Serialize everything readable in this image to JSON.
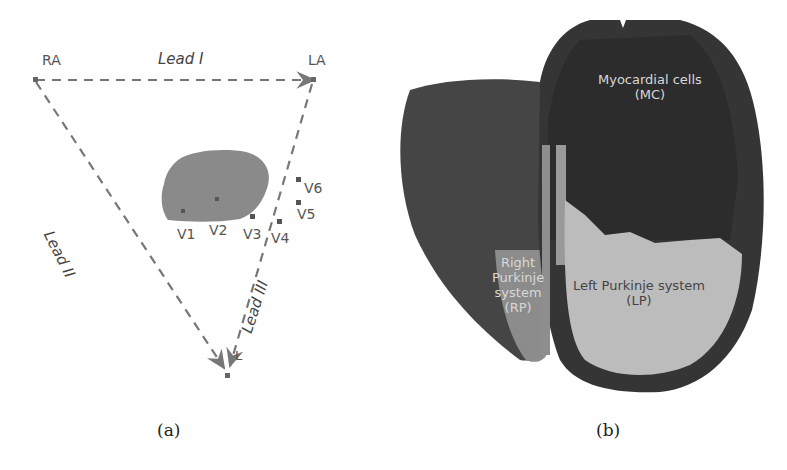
{
  "panel_a": {
    "caption": "(a)",
    "vertices": {
      "ra": "RA",
      "la": "LA",
      "ll": "L"
    },
    "leads": {
      "lead1": "Lead I",
      "lead2": "Lead II",
      "lead3": "Lead III"
    },
    "electrodes": [
      "V1",
      "V2",
      "V3",
      "V4",
      "V5",
      "V6"
    ]
  },
  "panel_b": {
    "caption": "(b)",
    "regions": {
      "mc_name": "Myocardial cells",
      "mc_abbr": "(MC)",
      "rp_line1": "Right",
      "rp_line2": "Purkinje",
      "rp_line3": "system",
      "rp_abbr": "(RP)",
      "lp_name": "Left Purkinje system",
      "lp_abbr": "(LP)"
    }
  },
  "colors": {
    "line": "#777777",
    "heart_small": "#8a8a8a",
    "myocardium": "#3d3d3d",
    "myocardium_dark": "#2e2e2e",
    "right_ventricle": "#4a4a4a",
    "purkinje_left": "#bdbdbd",
    "purkinje_right": "#8c8c8c"
  }
}
